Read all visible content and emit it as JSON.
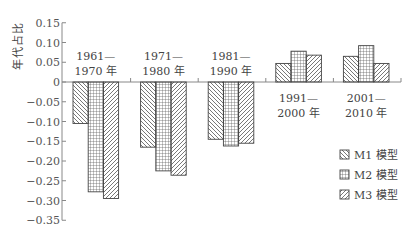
{
  "chart_data": {
    "type": "bar",
    "title": "",
    "xlabel": "",
    "ylabel": "年代占比",
    "ylim": [
      -0.35,
      0.15
    ],
    "yticks": [
      0.15,
      0.1,
      0.05,
      0,
      -0.05,
      -0.1,
      -0.15,
      -0.2,
      -0.25,
      -0.3,
      -0.35
    ],
    "ytick_labels": [
      "0.15",
      "0.10",
      "0.05",
      "0",
      "−0.05",
      "−0.10",
      "−0.15",
      "−0.20",
      "−0.25",
      "−0.30",
      "−0.35"
    ],
    "categories": [
      "1961—1970 年",
      "1971—1980 年",
      "1981—1990 年",
      "1991—2000 年",
      "2001—2010 年"
    ],
    "category_lines": [
      [
        "1961—",
        "1970 年"
      ],
      [
        "1971—",
        "1980 年"
      ],
      [
        "1981—",
        "1990 年"
      ],
      [
        "1991—",
        "2000 年"
      ],
      [
        "2001—",
        "2010 年"
      ]
    ],
    "series": [
      {
        "name": "M1 模型",
        "pattern": "backslash-hatch",
        "values": [
          -0.105,
          -0.165,
          -0.145,
          0.047,
          0.065
        ]
      },
      {
        "name": "M2 模型",
        "pattern": "grid-hatch",
        "values": [
          -0.278,
          -0.225,
          -0.162,
          0.078,
          0.092
        ]
      },
      {
        "name": "M3 模型",
        "pattern": "slash-hatch",
        "values": [
          -0.295,
          -0.236,
          -0.155,
          0.068,
          0.047
        ]
      }
    ],
    "grid": false,
    "legend_position": "lower right"
  },
  "colors": {
    "axis": "#888888",
    "bar_stroke": "#444444",
    "hatch": "#555555"
  }
}
